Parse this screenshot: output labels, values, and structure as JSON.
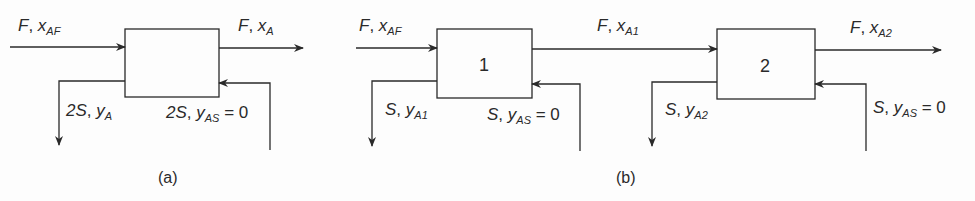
{
  "diagram_a": {
    "caption": "(a)",
    "feed": {
      "var": "F",
      "comp": "x",
      "sub": "AF"
    },
    "raffinate": {
      "var": "F",
      "comp": "x",
      "sub": "A"
    },
    "extract": {
      "var": "2S",
      "comp": "y",
      "sub": "A"
    },
    "solvent": {
      "var": "2S",
      "comp": "y",
      "sub": "AS",
      "eq": " = 0"
    }
  },
  "diagram_b": {
    "caption": "(b)",
    "stage1": {
      "label": "1"
    },
    "stage2": {
      "label": "2"
    },
    "feed": {
      "var": "F",
      "comp": "x",
      "sub": "AF"
    },
    "intermediate": {
      "var": "F",
      "comp": "x",
      "sub": "A1"
    },
    "raffinate": {
      "var": "F",
      "comp": "x",
      "sub": "A2"
    },
    "extract1": {
      "var": "S",
      "comp": "y",
      "sub": "A1"
    },
    "solvent1": {
      "var": "S",
      "comp": "y",
      "sub": "AS",
      "eq": " = 0"
    },
    "extract2": {
      "var": "S",
      "comp": "y",
      "sub": "A2"
    },
    "solvent2": {
      "var": "S",
      "comp": "y",
      "sub": "AS",
      "eq": " = 0"
    }
  },
  "colors": {
    "line": "#2a2a2a",
    "background": "#fdfdfd"
  }
}
